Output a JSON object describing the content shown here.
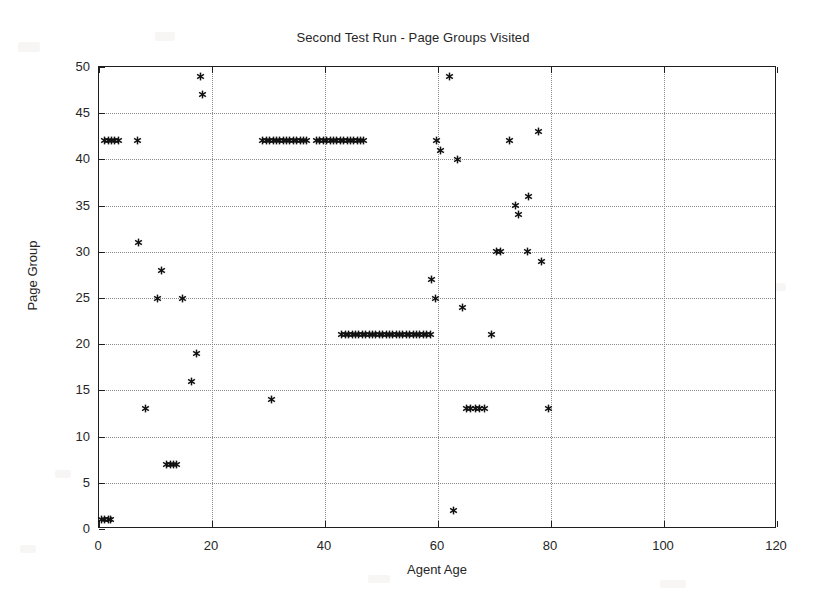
{
  "chart_data": {
    "type": "scatter",
    "title": "Second Test Run - Page Groups Visited",
    "xlabel": "Agent Age",
    "ylabel": "Page Group",
    "xlim": [
      0,
      120
    ],
    "ylim": [
      0,
      50
    ],
    "xticks": [
      0,
      20,
      40,
      60,
      80,
      100,
      120
    ],
    "yticks": [
      0,
      5,
      10,
      15,
      20,
      25,
      30,
      35,
      40,
      45,
      50
    ],
    "grid": true,
    "legend": null,
    "marker": "asterisk",
    "marker_color": "#111111",
    "series": [
      {
        "name": "Page Groups Visited",
        "points": [
          [
            0.5,
            1
          ],
          [
            1.0,
            1
          ],
          [
            1.6,
            1
          ],
          [
            2.1,
            1
          ],
          [
            1.0,
            42
          ],
          [
            1.6,
            42
          ],
          [
            2.2,
            42
          ],
          [
            2.8,
            42
          ],
          [
            3.4,
            42
          ],
          [
            6.9,
            42
          ],
          [
            7.0,
            31
          ],
          [
            8.3,
            13
          ],
          [
            10.4,
            25
          ],
          [
            11.0,
            28
          ],
          [
            12.0,
            7
          ],
          [
            12.6,
            7
          ],
          [
            13.2,
            7
          ],
          [
            13.8,
            7
          ],
          [
            14.8,
            25
          ],
          [
            16.3,
            16
          ],
          [
            17.3,
            19
          ],
          [
            18.0,
            49
          ],
          [
            18.3,
            47
          ],
          [
            30.6,
            14
          ],
          [
            29.0,
            42
          ],
          [
            29.6,
            42
          ],
          [
            30.2,
            42
          ],
          [
            30.8,
            42
          ],
          [
            31.4,
            42
          ],
          [
            32.0,
            42
          ],
          [
            32.6,
            42
          ],
          [
            33.2,
            42
          ],
          [
            33.8,
            42
          ],
          [
            34.4,
            42
          ],
          [
            35.0,
            42
          ],
          [
            35.6,
            42
          ],
          [
            36.2,
            42
          ],
          [
            36.8,
            42
          ],
          [
            38.5,
            42
          ],
          [
            39.1,
            42
          ],
          [
            39.7,
            42
          ],
          [
            40.3,
            42
          ],
          [
            40.9,
            42
          ],
          [
            41.5,
            42
          ],
          [
            42.1,
            42
          ],
          [
            42.7,
            42
          ],
          [
            43.3,
            42
          ],
          [
            43.9,
            42
          ],
          [
            44.5,
            42
          ],
          [
            45.1,
            42
          ],
          [
            45.7,
            42
          ],
          [
            46.3,
            42
          ],
          [
            46.9,
            42
          ],
          [
            43.0,
            21
          ],
          [
            43.6,
            21
          ],
          [
            44.2,
            21
          ],
          [
            44.8,
            21
          ],
          [
            45.4,
            21
          ],
          [
            46.0,
            21
          ],
          [
            46.6,
            21
          ],
          [
            47.2,
            21
          ],
          [
            47.8,
            21
          ],
          [
            48.4,
            21
          ],
          [
            49.0,
            21
          ],
          [
            49.6,
            21
          ],
          [
            50.2,
            21
          ],
          [
            50.8,
            21
          ],
          [
            51.4,
            21
          ],
          [
            52.0,
            21
          ],
          [
            52.6,
            21
          ],
          [
            53.2,
            21
          ],
          [
            53.8,
            21
          ],
          [
            54.4,
            21
          ],
          [
            55.0,
            21
          ],
          [
            55.6,
            21
          ],
          [
            56.2,
            21
          ],
          [
            56.8,
            21
          ],
          [
            57.4,
            21
          ],
          [
            58.0,
            21
          ],
          [
            58.6,
            21
          ],
          [
            58.8,
            27
          ],
          [
            59.6,
            25
          ],
          [
            60.5,
            41
          ],
          [
            62.0,
            49
          ],
          [
            62.7,
            2
          ],
          [
            63.5,
            40
          ],
          [
            64.4,
            24
          ],
          [
            65.0,
            13
          ],
          [
            65.8,
            13
          ],
          [
            66.6,
            13
          ],
          [
            67.4,
            13
          ],
          [
            68.2,
            13
          ],
          [
            69.4,
            21
          ],
          [
            70.3,
            30
          ],
          [
            71.0,
            30
          ],
          [
            72.6,
            42
          ],
          [
            73.8,
            35
          ],
          [
            74.3,
            34
          ],
          [
            75.9,
            30
          ],
          [
            76.0,
            36
          ],
          [
            77.7,
            43
          ],
          [
            78.4,
            29
          ],
          [
            79.6,
            13
          ],
          [
            59.8,
            42
          ]
        ]
      }
    ]
  },
  "background_artifacts": [
    {
      "x": 18,
      "y": 42,
      "w": 22,
      "h": 10
    },
    {
      "x": 155,
      "y": 32,
      "w": 20,
      "h": 9
    },
    {
      "x": 300,
      "y": 100,
      "w": 26,
      "h": 10
    },
    {
      "x": 616,
      "y": 120,
      "w": 18,
      "h": 8
    },
    {
      "x": 705,
      "y": 210,
      "w": 20,
      "h": 9
    },
    {
      "x": 133,
      "y": 300,
      "w": 18,
      "h": 8
    },
    {
      "x": 250,
      "y": 330,
      "w": 18,
      "h": 8
    },
    {
      "x": 600,
      "y": 420,
      "w": 22,
      "h": 9
    },
    {
      "x": 746,
      "y": 402,
      "w": 18,
      "h": 8
    },
    {
      "x": 55,
      "y": 470,
      "w": 16,
      "h": 8
    },
    {
      "x": 368,
      "y": 575,
      "w": 22,
      "h": 8
    },
    {
      "x": 660,
      "y": 580,
      "w": 26,
      "h": 8
    },
    {
      "x": 772,
      "y": 283,
      "w": 14,
      "h": 8
    },
    {
      "x": 20,
      "y": 545,
      "w": 16,
      "h": 8
    }
  ]
}
